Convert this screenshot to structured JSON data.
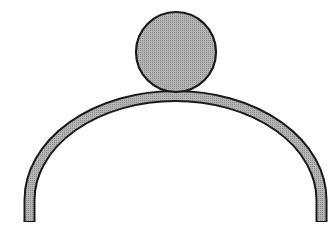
{
  "diagram": {
    "colors": {
      "background": "#ffffff",
      "fill": "#a8a8a8",
      "stroke": "#1a1a1a"
    },
    "ball": {
      "cx": 176,
      "cy": 52,
      "r": 40
    },
    "arch": {
      "left_x": 29.5,
      "right_x": 321.5,
      "bottom_y": 222,
      "top_y": 96.5,
      "thickness": 10
    }
  }
}
